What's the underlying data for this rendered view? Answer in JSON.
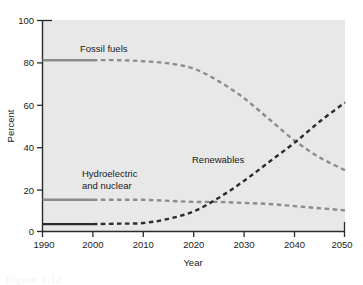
{
  "figure": {
    "background_color": "#ffffff",
    "plot_background_color": "#e8e8e8",
    "caption_partial": "Figure 1.12"
  },
  "chart_data": {
    "type": "line",
    "title": "",
    "xlabel": "Year",
    "ylabel": "Percent",
    "xlim": [
      1990,
      2050
    ],
    "ylim": [
      0,
      100
    ],
    "xticks": [
      1990,
      2000,
      2010,
      2020,
      2030,
      2040,
      2050
    ],
    "yticks": [
      0,
      20,
      40,
      60,
      80,
      100
    ],
    "grid": false,
    "legend_position": "inline-annotations",
    "x": [
      1990,
      1995,
      2000,
      2005,
      2010,
      2015,
      2020,
      2025,
      2030,
      2035,
      2040,
      2045,
      2050
    ],
    "series": [
      {
        "name": "Fossil fuels",
        "color": "#8c8c8c",
        "solid_until": 2000,
        "values": [
          81,
          81,
          81,
          81,
          80.5,
          79.5,
          77,
          71,
          63,
          53,
          43,
          35,
          29
        ]
      },
      {
        "name": "Hydroelectric and nuclear",
        "color": "#8c8c8c",
        "solid_until": 2000,
        "values": [
          15,
          15,
          15,
          15,
          15,
          14.5,
          14,
          14,
          13.5,
          13,
          12,
          11,
          10
        ]
      },
      {
        "name": "Renewables",
        "color": "#2b2b2b",
        "solid_until": 2000,
        "values": [
          3.5,
          3.5,
          3.5,
          3.7,
          4,
          6,
          9.5,
          16,
          24,
          33,
          42,
          52,
          61
        ]
      }
    ],
    "annotations": [
      {
        "text": "Fossil fuels",
        "x": 2004,
        "y": 88
      },
      {
        "text": "Hydroelectric",
        "x": 2001,
        "y": 27
      },
      {
        "text": "and nuclear",
        "x": 2001,
        "y": 21
      },
      {
        "text": "Renewables",
        "x": 2025,
        "y": 34
      }
    ]
  },
  "axes": {
    "y_axis_label": "Percent",
    "x_axis_label": "Year",
    "y_tick_labels": [
      "0",
      "20",
      "40",
      "60",
      "80",
      "100"
    ],
    "x_tick_labels": [
      "1990",
      "2000",
      "2010",
      "2020",
      "2030",
      "2040",
      "2050"
    ]
  },
  "labels": {
    "fossil_fuels": "Fossil fuels",
    "hydro_line1": "Hydroelectric",
    "hydro_line2": "and nuclear",
    "renewables": "Renewables"
  }
}
